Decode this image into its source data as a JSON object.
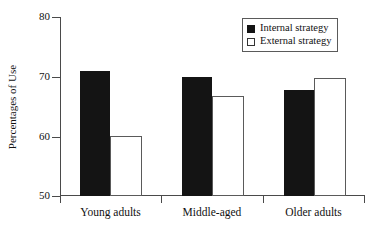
{
  "chart_data": {
    "type": "bar",
    "title": "",
    "xlabel": "",
    "ylabel": "Percentages of Use",
    "categories": [
      "Young adults",
      "Middle-aged",
      "Older adults"
    ],
    "series": [
      {
        "name": "Internal strategy",
        "values": [
          71.0,
          70.0,
          67.7
        ],
        "color": "#141414",
        "fill": "solid"
      },
      {
        "name": "External strategy",
        "values": [
          60.0,
          66.7,
          69.7
        ],
        "color": "#ffffff",
        "fill": "open"
      }
    ],
    "ylim": [
      50,
      80
    ],
    "yticks": [
      50,
      60,
      70,
      80
    ],
    "ytick_labels": [
      "50",
      "60",
      "70",
      "80"
    ],
    "grid": false,
    "legend_position": "top-right"
  },
  "axes": {
    "y_title": "Percentages of Use",
    "y_tick_labels": [
      "80",
      "70",
      "60",
      "50"
    ],
    "x_tick_labels": [
      "Young adults",
      "Middle-aged",
      "Older adults"
    ]
  },
  "legend": {
    "entries": [
      {
        "label": "Internal strategy",
        "marker": "filled-square-icon"
      },
      {
        "label": "External strategy",
        "marker": "open-square-icon"
      }
    ]
  },
  "colors": {
    "internal_bar": "#141414",
    "external_bar": "#ffffff",
    "axis": "#4a4a4a",
    "background": "#ffffff"
  }
}
